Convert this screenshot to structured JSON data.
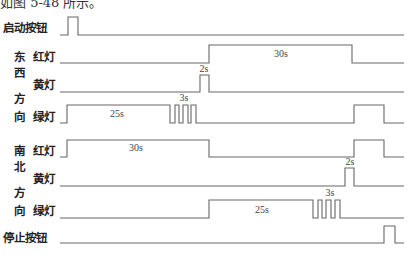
{
  "caption": "如图 5-48 所示。",
  "labels": [
    {
      "text": "启动按钮",
      "x": 3,
      "y": 27
    },
    {
      "text": "东",
      "x": 14,
      "y": 56
    },
    {
      "text": "红灯",
      "x": 33,
      "y": 56
    },
    {
      "text": "西",
      "x": 14,
      "y": 72
    },
    {
      "text": "黄灯",
      "x": 33,
      "y": 84
    },
    {
      "text": "方",
      "x": 14,
      "y": 98
    },
    {
      "text": "向",
      "x": 14,
      "y": 116
    },
    {
      "text": "绿灯",
      "x": 33,
      "y": 116
    },
    {
      "text": "南",
      "x": 14,
      "y": 150
    },
    {
      "text": "红灯",
      "x": 33,
      "y": 150
    },
    {
      "text": "北",
      "x": 14,
      "y": 166
    },
    {
      "text": "黄灯",
      "x": 33,
      "y": 178
    },
    {
      "text": "方",
      "x": 14,
      "y": 192
    },
    {
      "text": "向",
      "x": 14,
      "y": 210
    },
    {
      "text": "绿灯",
      "x": 33,
      "y": 210
    },
    {
      "text": "停止按钮",
      "x": 3,
      "y": 237
    }
  ],
  "signals": [
    {
      "name": "start-button",
      "high": 17,
      "low": 35,
      "x0": 60,
      "x1": 404,
      "edges": [
        [
          60,
          0
        ],
        [
          68,
          1
        ],
        [
          78,
          0
        ]
      ],
      "notes": []
    },
    {
      "name": "ew-red",
      "high": 45,
      "low": 63,
      "x0": 60,
      "x1": 404,
      "edges": [
        [
          60,
          0
        ],
        [
          209,
          1
        ],
        [
          352,
          0
        ]
      ],
      "notes": [
        {
          "text": "30s",
          "x": 281,
          "y": 57
        }
      ]
    },
    {
      "name": "ew-yellow",
      "high": 75,
      "low": 92,
      "x0": 60,
      "x1": 404,
      "edges": [
        [
          60,
          0
        ],
        [
          200,
          1
        ],
        [
          209,
          0
        ]
      ],
      "notes": [
        {
          "text": "2s",
          "x": 204,
          "y": 72
        }
      ]
    },
    {
      "name": "ew-green",
      "high": 105,
      "low": 123,
      "x0": 60,
      "x1": 404,
      "edges": [
        [
          60,
          0
        ],
        [
          67,
          1
        ],
        [
          170,
          0
        ],
        [
          175,
          1
        ],
        [
          179,
          0
        ],
        [
          183,
          1
        ],
        [
          188,
          0
        ],
        [
          191,
          1
        ],
        [
          196,
          0
        ],
        [
          354,
          1
        ],
        [
          384,
          0
        ]
      ],
      "notes": [
        {
          "text": "25s",
          "x": 117,
          "y": 117
        },
        {
          "text": "3s",
          "x": 184,
          "y": 101
        }
      ]
    },
    {
      "name": "ns-red",
      "high": 140,
      "low": 157,
      "x0": 60,
      "x1": 404,
      "edges": [
        [
          60,
          0
        ],
        [
          67,
          1
        ],
        [
          209,
          0
        ],
        [
          354,
          1
        ],
        [
          384,
          0
        ]
      ],
      "notes": [
        {
          "text": "30s",
          "x": 136,
          "y": 151
        }
      ]
    },
    {
      "name": "ns-yellow",
      "high": 168,
      "low": 186,
      "x0": 60,
      "x1": 404,
      "edges": [
        [
          60,
          0
        ],
        [
          345,
          1
        ],
        [
          354,
          0
        ]
      ],
      "notes": [
        {
          "text": "2s",
          "x": 350,
          "y": 165
        }
      ]
    },
    {
      "name": "ns-green",
      "high": 200,
      "low": 218,
      "x0": 60,
      "x1": 404,
      "edges": [
        [
          60,
          0
        ],
        [
          209,
          1
        ],
        [
          313,
          0
        ],
        [
          318,
          1
        ],
        [
          322,
          0
        ],
        [
          326,
          1
        ],
        [
          331,
          0
        ],
        [
          335,
          1
        ],
        [
          340,
          0
        ]
      ],
      "notes": [
        {
          "text": "25s",
          "x": 262,
          "y": 213
        },
        {
          "text": "3s",
          "x": 330,
          "y": 196
        }
      ]
    },
    {
      "name": "stop-button",
      "high": 226,
      "low": 243,
      "x0": 60,
      "x1": 404,
      "edges": [
        [
          60,
          0
        ],
        [
          384,
          1
        ],
        [
          395,
          0
        ]
      ],
      "notes": []
    }
  ]
}
